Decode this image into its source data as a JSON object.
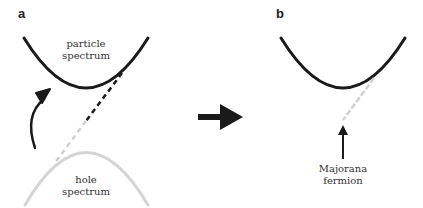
{
  "panels": {
    "a": {
      "label": "a",
      "particle_label_line1": "particle",
      "particle_label_line2": "spectrum",
      "hole_label_line1": "hole",
      "hole_label_line2": "spectrum"
    },
    "b": {
      "label": "b",
      "majorana_label_line1": "Majorana",
      "majorana_label_line2": "fermion"
    }
  },
  "colors": {
    "particle_curve": "#1a1a1a",
    "hole_curve": "#d0d0d0",
    "arrow": "#1a1a1a",
    "dashed_light": "#cfcfcf"
  }
}
